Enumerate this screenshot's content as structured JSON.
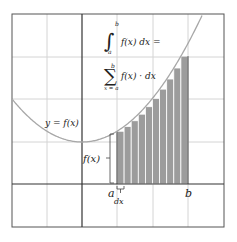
{
  "diagram": {
    "curve_label": "y = f(x)",
    "integral_expr": "f(x) dx =",
    "integral_lower": "a",
    "integral_upper": "b",
    "sum_expr": "f(x) · dx",
    "sum_lower": "x = a",
    "sum_upper": "b",
    "sum_symbol": "∑",
    "integral_symbol": "∫",
    "height_label": "f(x)",
    "a_label": "a",
    "b_label": "b",
    "dx_label": "dx",
    "num_bars": 10,
    "colors": {
      "grid": "#d4d4d4",
      "axis": "#333333",
      "curve": "#a8a8a8",
      "bar_fill": "#9c9c9c",
      "bar_separator": "#ffffff"
    }
  }
}
